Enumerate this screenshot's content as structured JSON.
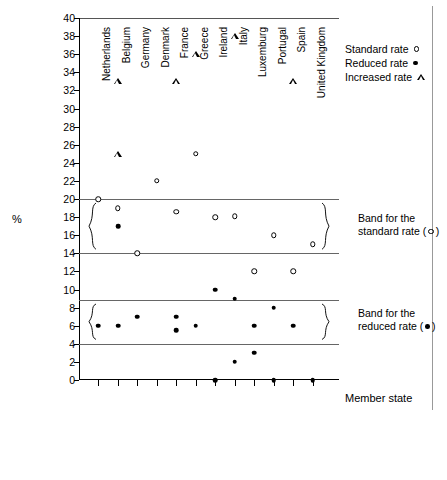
{
  "chart_data": {
    "type": "scatter",
    "title": "",
    "xlabel": "Member state",
    "ylabel": "%",
    "ylim": [
      0,
      40
    ],
    "ytick_step": 2,
    "yticks": [
      0,
      2,
      4,
      6,
      8,
      10,
      12,
      14,
      16,
      18,
      20,
      22,
      24,
      26,
      28,
      30,
      32,
      34,
      36,
      38,
      40
    ],
    "grid": false,
    "legend_position": "top-right",
    "categories": [
      "Netherlands",
      "Belgium",
      "Germany",
      "Denmark",
      "France",
      "Greece",
      "Ireland",
      "Italy",
      "Luxemburg",
      "Portugal",
      "Spain",
      "United Kingdom"
    ],
    "series": [
      {
        "name": "Standard rate",
        "marker": "open-circle",
        "values": [
          20,
          19,
          14,
          22,
          18.6,
          25,
          18,
          18.1,
          12,
          16,
          12,
          15
        ],
        "points": [
          {
            "category": "Netherlands",
            "value": 20
          },
          {
            "category": "Belgium",
            "value": 19
          },
          {
            "category": "Germany",
            "value": 14
          },
          {
            "category": "Denmark",
            "value": 22
          },
          {
            "category": "France",
            "value": 18.6
          },
          {
            "category": "Greece",
            "value": 25
          },
          {
            "category": "Ireland",
            "value": 18
          },
          {
            "category": "Italy",
            "value": 18.1
          },
          {
            "category": "Luxemburg",
            "value": 12
          },
          {
            "category": "Portugal",
            "value": 16
          },
          {
            "category": "Spain",
            "value": 12
          },
          {
            "category": "United Kingdom",
            "value": 15
          }
        ]
      },
      {
        "name": "Reduced rate",
        "marker": "filled-circle",
        "points": [
          {
            "category": "Netherlands",
            "value": 6
          },
          {
            "category": "Belgium",
            "value": 17
          },
          {
            "category": "Belgium",
            "value": 6
          },
          {
            "category": "Germany",
            "value": 7
          },
          {
            "category": "France",
            "value": 7
          },
          {
            "category": "France",
            "value": 5.5
          },
          {
            "category": "Greece",
            "value": 6
          },
          {
            "category": "Ireland",
            "value": 10
          },
          {
            "category": "Ireland",
            "value": 0
          },
          {
            "category": "Italy",
            "value": 9
          },
          {
            "category": "Italy",
            "value": 2
          },
          {
            "category": "Luxemburg",
            "value": 6
          },
          {
            "category": "Luxemburg",
            "value": 3
          },
          {
            "category": "Portugal",
            "value": 8
          },
          {
            "category": "Portugal",
            "value": 0
          },
          {
            "category": "Spain",
            "value": 6
          },
          {
            "category": "United Kingdom",
            "value": 0
          }
        ]
      },
      {
        "name": "Increased rate",
        "marker": "open-triangle",
        "points": [
          {
            "category": "Belgium",
            "value": 33
          },
          {
            "category": "Belgium",
            "value": 25
          },
          {
            "category": "France",
            "value": 33
          },
          {
            "category": "Greece",
            "value": 36
          },
          {
            "category": "Italy",
            "value": 38
          },
          {
            "category": "Spain",
            "value": 33
          }
        ]
      }
    ],
    "bands": [
      {
        "name": "Band for the standard rate",
        "marker": "open-circle",
        "upper": 20,
        "lower": 14
      },
      {
        "name": "Band for the reduced rate",
        "marker": "filled-circle",
        "upper": 8.8,
        "lower": 4
      }
    ]
  },
  "legend": {
    "items": [
      {
        "label": "Standard rate",
        "marker": "open-circle"
      },
      {
        "label": "Reduced rate",
        "marker": "filled-circle"
      },
      {
        "label": "Increased rate",
        "marker": "open-triangle"
      }
    ]
  },
  "annotations": {
    "standard_band": {
      "line1": "Band for the",
      "line2_prefix": "standard rate (",
      "line2_suffix": ")"
    },
    "reduced_band": {
      "line1": "Band for the",
      "line2_prefix": "reduced rate (",
      "line2_suffix": ")"
    }
  },
  "axes": {
    "y_title": "%",
    "x_title": "Member state"
  },
  "colors": {
    "marker": "#000000",
    "axis": "#000000",
    "band_line": "#666666",
    "background": "#ffffff"
  }
}
